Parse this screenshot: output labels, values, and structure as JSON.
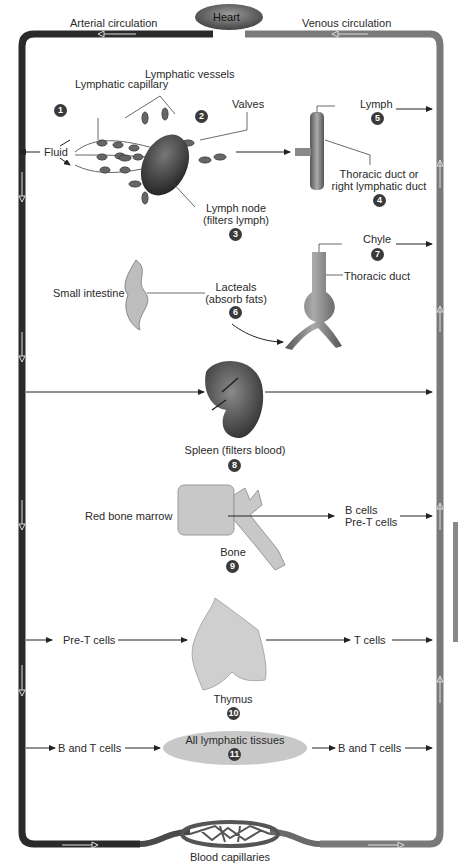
{
  "header": {
    "arterial_label": "Arterial circulation",
    "venous_label": "Venous circulation",
    "heart_label": "Heart"
  },
  "footer": {
    "capillaries_label": "Blood capillaries"
  },
  "colors": {
    "arterial": "#2b2b2b",
    "venous": "#7a7a7a",
    "badge": "#3a3a3a",
    "tissue_ellipse": "#c8c8c8"
  },
  "steps": [
    {
      "num": "1",
      "labels": [
        "Lymphatic capillary",
        "Fluid"
      ]
    },
    {
      "num": "2",
      "labels": [
        "Lymphatic vessels",
        "Valves"
      ]
    },
    {
      "num": "3",
      "labels": [
        "Lymph node",
        "(filters lymph)"
      ]
    },
    {
      "num": "4",
      "labels": [
        "Thoracic duct or",
        "right lymphatic duct"
      ]
    },
    {
      "num": "5",
      "labels": [
        "Lymph"
      ]
    },
    {
      "num": "6",
      "labels": [
        "Small intestine",
        "Lacteals",
        "(absorb fats)"
      ]
    },
    {
      "num": "7",
      "labels": [
        "Chyle",
        "Thoracic duct"
      ]
    },
    {
      "num": "8",
      "labels": [
        "Spleen (filters blood)"
      ]
    },
    {
      "num": "9",
      "labels": [
        "Red bone marrow",
        "Bone",
        "B cells",
        "Pre-T cells"
      ]
    },
    {
      "num": "10",
      "labels": [
        "Pre-T cells",
        "Thymus",
        "T cells"
      ]
    },
    {
      "num": "11",
      "labels": [
        "B and T cells",
        "All lymphatic tissues",
        "B and T cells"
      ]
    }
  ]
}
